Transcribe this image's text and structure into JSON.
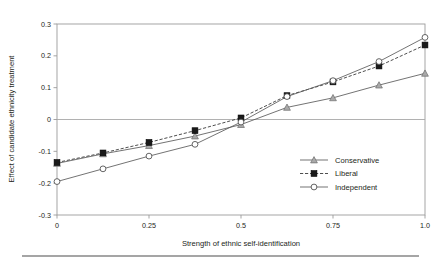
{
  "chart_data": {
    "type": "line",
    "title": "",
    "xlabel": "Strength of ethnic self-identification",
    "ylabel": "Effect of candidate ethnicity treatment",
    "xlim": [
      0,
      1
    ],
    "ylim": [
      -0.3,
      0.3
    ],
    "grid": false,
    "legend_position": "bottom-right",
    "x": [
      0,
      0.125,
      0.25,
      0.375,
      0.5,
      0.625,
      0.75,
      0.875,
      1.0
    ],
    "xticks": [
      "0",
      "0.25",
      "0.5",
      "0.75",
      "1.0"
    ],
    "xtick_values": [
      0,
      0.25,
      0.5,
      0.75,
      1.0
    ],
    "yticks": [
      "0.3",
      "0.2",
      "0.1",
      "0",
      "-0.1",
      "-0.2",
      "-0.3"
    ],
    "ytick_values": [
      0.3,
      0.2,
      0.1,
      0,
      -0.1,
      -0.2,
      -0.3
    ],
    "series": [
      {
        "name": "Conservative",
        "marker": "triangle-up",
        "line_style": "solid",
        "values": [
          -0.138,
          -0.108,
          -0.082,
          -0.052,
          -0.016,
          0.038,
          0.068,
          0.108,
          0.145
        ]
      },
      {
        "name": "Liberal",
        "marker": "filled-square",
        "line_style": "dashed",
        "values": [
          -0.135,
          -0.105,
          -0.072,
          -0.035,
          0.005,
          0.075,
          0.118,
          0.168,
          0.234
        ]
      },
      {
        "name": "Independent",
        "marker": "open-circle",
        "line_style": "solid",
        "values": [
          -0.195,
          -0.155,
          -0.115,
          -0.078,
          -0.008,
          0.072,
          0.122,
          0.182,
          0.258
        ]
      }
    ]
  },
  "legend": {
    "items": [
      {
        "label": "Conservative"
      },
      {
        "label": "Liberal"
      },
      {
        "label": "Independent"
      }
    ]
  },
  "axes": {
    "x_title": "Strength of ethnic self-identification",
    "y_title": "Effect of candidate ethnicity treatment"
  },
  "colors": {
    "frame": "#9b9b9b",
    "zero_line": "#a8a8a8",
    "conservative": "#a9a9a9",
    "liberal": "#1a1a1a",
    "independent": "#ffffff",
    "text": "#231f20",
    "rule": "#4d4d4d"
  }
}
